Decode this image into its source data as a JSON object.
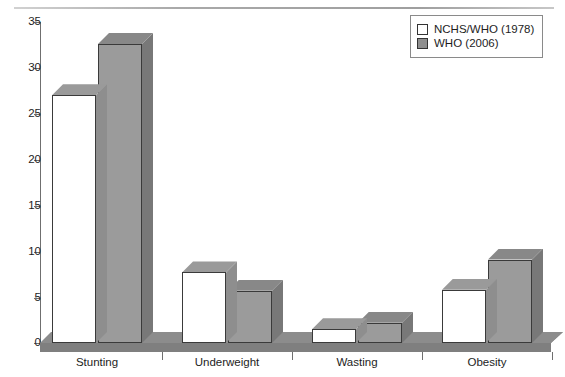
{
  "chart_data": {
    "type": "bar",
    "title": "",
    "subtitle": "",
    "xlabel": "",
    "ylabel": "",
    "categories": [
      "Stunting",
      "Underweight",
      "Wasting",
      "Obesity"
    ],
    "series": [
      {
        "name": "NCHS/WHO (1978)",
        "color": "#ffffff",
        "values": [
          27.0,
          7.7,
          1.5,
          5.8
        ]
      },
      {
        "name": "WHO (2006)",
        "color": "#9b9b9b",
        "values": [
          32.6,
          5.7,
          2.2,
          9.1
        ]
      }
    ],
    "ylim": [
      0,
      35
    ],
    "yticks": [
      0,
      5,
      10,
      15,
      20,
      25,
      30,
      35
    ],
    "ytick_labels": [
      "0",
      "5",
      "10",
      "15",
      "20",
      "25",
      "30",
      "35"
    ],
    "grid": false,
    "legend_position": "top-right",
    "style": "3d-column"
  },
  "legend": {
    "entries": [
      {
        "label": "NCHS/WHO (1978)",
        "swatch": "white"
      },
      {
        "label": "WHO (2006)",
        "swatch": "grey"
      }
    ]
  },
  "axis": {
    "y_ticks": [
      "35",
      "30",
      "25",
      "20",
      "15",
      "10",
      "5",
      "0"
    ],
    "x_labels": [
      "Stunting",
      "Underweight",
      "Wasting",
      "Obesity"
    ]
  },
  "colors": {
    "series_one": "#ffffff",
    "series_two": "#9b9b9b",
    "axis": "#6f6f6f",
    "floor": "#7f7f7f",
    "text": "#1d1d1d"
  }
}
